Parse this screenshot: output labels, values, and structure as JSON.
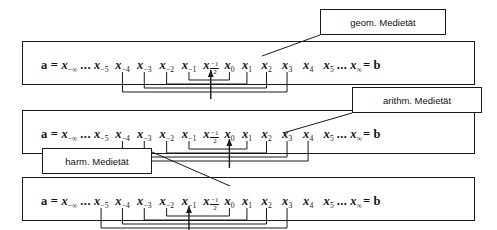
{
  "diagram": {
    "title_alt": "Medietaeten auf der Zahlenfolge a = x_-inf ... x_inf = b",
    "ink_color": "#1a1a1a",
    "background": "#ffffff"
  },
  "sequence": {
    "lead_a": "a",
    "equals": "=",
    "ellipsis": "...",
    "trail_b": "b",
    "x": "x",
    "tokens": [
      {
        "id": "x-inf",
        "sub": "−∞"
      },
      {
        "id": "x-5",
        "sub": "−5"
      },
      {
        "id": "x-4",
        "sub": "−4"
      },
      {
        "id": "x-3",
        "sub": "−3"
      },
      {
        "id": "x-2",
        "sub": "−2"
      },
      {
        "id": "x-1",
        "sub": "−1"
      },
      {
        "id": "x-half",
        "sub": "frac",
        "num": "−1",
        "den": "2"
      },
      {
        "id": "x0",
        "sub": "0"
      },
      {
        "id": "x1",
        "sub": "1"
      },
      {
        "id": "x2",
        "sub": "2"
      },
      {
        "id": "x3",
        "sub": "3"
      },
      {
        "id": "x4",
        "sub": "4"
      },
      {
        "id": "x5",
        "sub": "5"
      },
      {
        "id": "xinf",
        "sub": "∞"
      }
    ]
  },
  "rows": [
    {
      "id": "row-geometric",
      "center_token": "x-half",
      "callout": "geom. Medietät",
      "brackets": [
        {
          "from": "x-1",
          "to": "x0"
        },
        {
          "from": "x-2",
          "to": "x1"
        },
        {
          "from": "x-3",
          "to": "x2"
        },
        {
          "from": "x-4",
          "to": "x3"
        }
      ]
    },
    {
      "id": "row-arithmetic",
      "center_token": "x0",
      "callout": "arithm. Medietät",
      "brackets": [
        {
          "from": "x-1",
          "to": "x1"
        },
        {
          "from": "x-2",
          "to": "x2"
        },
        {
          "from": "x-3",
          "to": "x3"
        },
        {
          "from": "x-4",
          "to": "x4"
        }
      ]
    },
    {
      "id": "row-harmonic",
      "center_token": "x-1",
      "callout": "harm. Medietät",
      "brackets": [
        {
          "from": "x-2",
          "to": "x0"
        },
        {
          "from": "x-3",
          "to": "x1"
        },
        {
          "from": "x-4",
          "to": "x2"
        },
        {
          "from": "x-5",
          "to": "x3"
        }
      ]
    }
  ],
  "callouts": {
    "geom": "geom. Medietät",
    "arith": "arithm. Medietät",
    "harm": "harm. Medietät"
  }
}
